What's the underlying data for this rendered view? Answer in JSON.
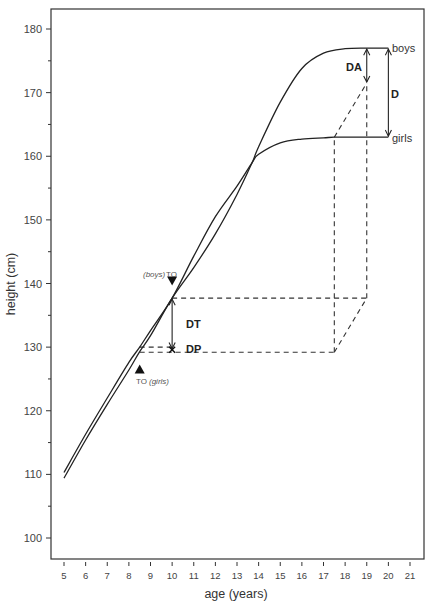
{
  "chart_data": {
    "type": "line",
    "title": "",
    "xlabel": "age (years)",
    "ylabel": "height (cm)",
    "xlim": [
      4.4,
      21.7
    ],
    "ylim": [
      97,
      183
    ],
    "x_ticks": [
      5,
      6,
      7,
      8,
      9,
      10,
      11,
      12,
      13,
      14,
      15,
      16,
      17,
      18,
      19,
      20,
      21
    ],
    "y_ticks_major": [
      100,
      110,
      120,
      130,
      140,
      150,
      160,
      170,
      180
    ],
    "y_ticks_minor": [
      105,
      115,
      125,
      135,
      145,
      155,
      165,
      175
    ],
    "grid": false,
    "legend": "inline labels at curve ends",
    "series": [
      {
        "name": "boys",
        "x": [
          5,
          6,
          7,
          8,
          8.5,
          9,
          10,
          11,
          12,
          13,
          13.7,
          14,
          15,
          16,
          17,
          18,
          19,
          20
        ],
        "y": [
          109.4,
          115.4,
          121.0,
          126.4,
          129.3,
          131.8,
          137.7,
          142.5,
          147.8,
          154.0,
          159.0,
          161.5,
          168.5,
          173.8,
          176.2,
          176.9,
          177.0,
          177.0
        ]
      },
      {
        "name": "girls",
        "x": [
          5,
          6,
          7,
          8,
          8.5,
          9,
          10,
          11,
          12,
          13,
          13.7,
          14,
          15,
          16,
          17,
          17.5,
          18,
          19,
          20
        ],
        "y": [
          110.3,
          116.3,
          122.0,
          127.6,
          130.0,
          132.6,
          137.7,
          144.3,
          150.5,
          155.3,
          159.0,
          160.3,
          162.1,
          162.7,
          162.9,
          163.0,
          163.0,
          163.0,
          163.0
        ]
      }
    ],
    "markers": [
      {
        "label_prefix": "(boys)",
        "label": "TO",
        "x": 10,
        "y": 140.3,
        "shape": "triangle-down"
      },
      {
        "label": "TO",
        "label_suffix": "(girls)",
        "x": 8.5,
        "y": 126.5,
        "shape": "triangle-up"
      }
    ],
    "annotations": [
      {
        "label": "DT",
        "type": "double-arrow",
        "x": 10,
        "y_from": 137.7,
        "y_to": 129.6
      },
      {
        "label": "DP",
        "type": "point-x",
        "x": 10,
        "y": 129.6
      },
      {
        "label": "DA",
        "type": "double-arrow",
        "x": 19,
        "y_from": 177.0,
        "y_to": 171.5
      },
      {
        "label": "D",
        "type": "double-arrow",
        "x": 20,
        "y_from": 177.0,
        "y_to": 163.0
      }
    ],
    "dashed_guides": [
      {
        "from": [
          10,
          137.7
        ],
        "to": [
          19,
          137.7
        ]
      },
      {
        "from": [
          8.5,
          130.0
        ],
        "to": [
          10,
          130.0
        ]
      },
      {
        "from": [
          8.5,
          129.2
        ],
        "to": [
          17.5,
          129.2
        ]
      },
      {
        "from": [
          17.5,
          129.2
        ],
        "to": [
          17.5,
          163.0
        ]
      },
      {
        "from": [
          19,
          137.7
        ],
        "to": [
          19,
          171.5
        ]
      },
      {
        "from": [
          17.5,
          129.2
        ],
        "to": [
          19,
          137.7
        ]
      },
      {
        "from": [
          17.5,
          163.0
        ],
        "to": [
          19,
          171.5
        ]
      }
    ]
  },
  "labels": {
    "boys": "boys",
    "girls": "girls",
    "boys_to_prefix": "(boys)",
    "boys_to": "TO",
    "girls_to": "TO",
    "girls_to_suffix": "(girls)",
    "dt": "DT",
    "dp": "DP",
    "da": "DA",
    "d": "D"
  }
}
